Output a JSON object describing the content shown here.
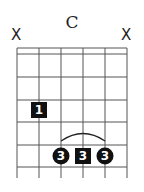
{
  "chord": {
    "name": "C"
  },
  "muted": [
    {
      "string": 6,
      "label": "X"
    },
    {
      "string": 1,
      "label": "X"
    }
  ],
  "fingers": [
    {
      "label": "1",
      "shape": "square",
      "string": 5,
      "fret": 2
    },
    {
      "label": "3",
      "shape": "circle",
      "string": 4,
      "fret": 4
    },
    {
      "label": "3",
      "shape": "square",
      "string": 3,
      "fret": 4
    },
    {
      "label": "3",
      "shape": "circle",
      "string": 2,
      "fret": 4
    }
  ],
  "barre": {
    "from_string": 4,
    "to_string": 2,
    "fret": 4
  }
}
